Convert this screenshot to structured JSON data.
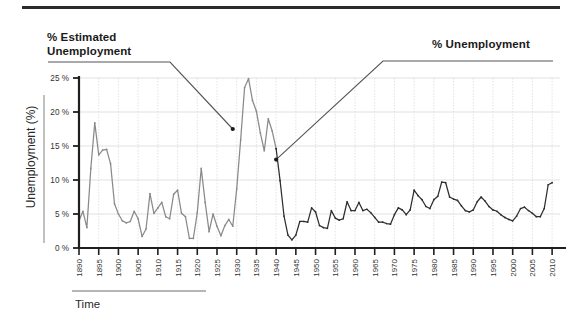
{
  "figure": {
    "annotations": {
      "left": "% Estimated\nUnemployment",
      "right": "% Unemployment"
    },
    "axis_titles": {
      "y": "Unemployment (%)",
      "x": "Time"
    }
  },
  "chart_data": {
    "type": "line",
    "title": "",
    "subtitle": "",
    "xlabel": "Time",
    "ylabel": "Unemployment (%)",
    "xlim": [
      1890,
      2012
    ],
    "ylim": [
      0,
      26
    ],
    "grid": true,
    "legend_position": "annotations",
    "ytick_labels": [
      "0 %",
      "5 %",
      "10 %",
      "15 %",
      "20 %",
      "25 %"
    ],
    "ytick_values": [
      0,
      5,
      10,
      15,
      20,
      25
    ],
    "xtick_labels": [
      "1890",
      "1895",
      "1900",
      "1905",
      "1910",
      "1915",
      "1920",
      "1925",
      "1930",
      "1935",
      "1940",
      "1945",
      "1950",
      "1955",
      "1960",
      "1965",
      "1970",
      "1975",
      "1980",
      "1985",
      "1990",
      "1995",
      "2000",
      "2005",
      "2010"
    ],
    "xtick_values": [
      1890,
      1895,
      1900,
      1905,
      1910,
      1915,
      1920,
      1925,
      1930,
      1935,
      1940,
      1945,
      1950,
      1955,
      1960,
      1965,
      1970,
      1975,
      1980,
      1985,
      1990,
      1995,
      2000,
      2005,
      2010
    ],
    "annotations": [
      {
        "text": "% Estimated Unemployment",
        "points_to_x": 1929,
        "points_to_y": 17.5
      },
      {
        "text": "% Unemployment",
        "points_to_x": 1940,
        "points_to_y": 13.0
      }
    ],
    "series": [
      {
        "name": "% Estimated Unemployment",
        "color": "#8a8a8a",
        "x": [
          1890,
          1891,
          1892,
          1893,
          1894,
          1895,
          1896,
          1897,
          1898,
          1899,
          1900,
          1901,
          1902,
          1903,
          1904,
          1905,
          1906,
          1907,
          1908,
          1909,
          1910,
          1911,
          1912,
          1913,
          1914,
          1915,
          1916,
          1917,
          1918,
          1919,
          1920,
          1921,
          1922,
          1923,
          1924,
          1925,
          1926,
          1927,
          1928,
          1929,
          1930,
          1931,
          1932,
          1933,
          1934,
          1935,
          1936,
          1937,
          1938,
          1939,
          1940
        ],
        "values": [
          4.0,
          5.4,
          3.0,
          11.7,
          18.4,
          13.7,
          14.4,
          14.5,
          12.4,
          6.5,
          5.0,
          4.0,
          3.7,
          3.9,
          5.4,
          4.3,
          1.7,
          2.8,
          8.0,
          5.1,
          5.9,
          6.7,
          4.6,
          4.3,
          7.9,
          8.5,
          5.1,
          4.6,
          1.4,
          1.4,
          5.2,
          11.7,
          6.7,
          2.4,
          5.0,
          3.2,
          1.8,
          3.3,
          4.2,
          3.2,
          8.7,
          15.9,
          23.6,
          24.9,
          21.7,
          20.1,
          16.9,
          14.3,
          19.0,
          17.2,
          14.6
        ]
      },
      {
        "name": "% Unemployment",
        "color": "#2e2e2e",
        "x": [
          1940,
          1941,
          1942,
          1943,
          1944,
          1945,
          1946,
          1947,
          1948,
          1949,
          1950,
          1951,
          1952,
          1953,
          1954,
          1955,
          1956,
          1957,
          1958,
          1959,
          1960,
          1961,
          1962,
          1963,
          1964,
          1965,
          1966,
          1967,
          1968,
          1969,
          1970,
          1971,
          1972,
          1973,
          1974,
          1975,
          1976,
          1977,
          1978,
          1979,
          1980,
          1981,
          1982,
          1983,
          1984,
          1985,
          1986,
          1987,
          1988,
          1989,
          1990,
          1991,
          1992,
          1993,
          1994,
          1995,
          1996,
          1997,
          1998,
          1999,
          2000,
          2001,
          2002,
          2003,
          2004,
          2005,
          2006,
          2007,
          2008,
          2009,
          2010
        ],
        "values": [
          14.6,
          9.9,
          4.7,
          1.9,
          1.2,
          1.9,
          3.9,
          3.9,
          3.8,
          5.9,
          5.3,
          3.3,
          3.0,
          2.9,
          5.5,
          4.4,
          4.1,
          4.3,
          6.8,
          5.5,
          5.5,
          6.7,
          5.5,
          5.7,
          5.2,
          4.5,
          3.8,
          3.8,
          3.6,
          3.5,
          4.9,
          5.9,
          5.6,
          4.9,
          5.6,
          8.5,
          7.7,
          7.1,
          6.1,
          5.8,
          7.1,
          7.6,
          9.7,
          9.6,
          7.5,
          7.2,
          7.0,
          6.2,
          5.5,
          5.3,
          5.6,
          6.8,
          7.5,
          6.9,
          6.1,
          5.6,
          5.4,
          4.9,
          4.5,
          4.2,
          4.0,
          4.7,
          5.8,
          6.0,
          5.5,
          5.1,
          4.6,
          4.6,
          5.8,
          9.3,
          9.6
        ]
      }
    ]
  }
}
